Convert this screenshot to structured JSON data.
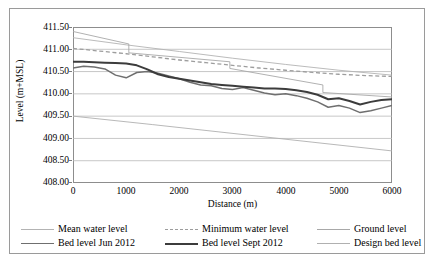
{
  "chart_data": {
    "type": "line",
    "title": "",
    "xlabel": "Distance (m)",
    "ylabel": "Level (m+MSL)",
    "xlim": [
      0,
      6000
    ],
    "ylim": [
      408.0,
      411.5
    ],
    "xticks": [
      "0",
      "1000",
      "2000",
      "3000",
      "4000",
      "5000",
      "6000"
    ],
    "yticks": [
      "411.50",
      "411.00",
      "410.50",
      "410.00",
      "409.50",
      "409.00",
      "408.50",
      "408.00"
    ],
    "grid": "horizontal",
    "legend_position": "bottom",
    "series": [
      {
        "name": "Mean water level",
        "style": "solid-thin-light",
        "color": "#b3b3b3",
        "x": [
          0,
          1000,
          2000,
          3000,
          4000,
          5000,
          6000
        ],
        "values": [
          411.26,
          411.1,
          410.95,
          410.8,
          410.66,
          410.53,
          410.42
        ]
      },
      {
        "name": "Minimum water level",
        "style": "dashed",
        "color": "#9d9d9d",
        "x": [
          0,
          500,
          1000,
          1500,
          2000,
          2500,
          3000,
          3500,
          4000,
          4500,
          5000,
          5500,
          6000
        ],
        "values": [
          411.02,
          410.96,
          410.9,
          410.83,
          410.76,
          410.7,
          410.64,
          410.58,
          410.53,
          410.48,
          410.44,
          410.41,
          410.39
        ]
      },
      {
        "name": "Ground level",
        "style": "solid-thin-stepped",
        "color": "#a8a8a8",
        "x": [
          0,
          1050,
          1050,
          2950,
          2950,
          4700,
          4700,
          6000
        ],
        "values": [
          411.4,
          411.12,
          410.92,
          410.72,
          410.57,
          410.2,
          410.03,
          409.93
        ]
      },
      {
        "name": "Bed level Jun 2012",
        "style": "solid-medium",
        "color": "#6f6f6f",
        "x": [
          0,
          200,
          400,
          600,
          800,
          1000,
          1200,
          1400,
          1600,
          1800,
          2000,
          2200,
          2400,
          2600,
          2800,
          3000,
          3200,
          3400,
          3600,
          3800,
          4000,
          4200,
          4400,
          4600,
          4800,
          5000,
          5200,
          5400,
          5600,
          5800,
          6000
        ],
        "values": [
          410.58,
          410.62,
          410.6,
          410.56,
          410.42,
          410.36,
          410.48,
          410.5,
          410.46,
          410.4,
          410.34,
          410.26,
          410.2,
          410.18,
          410.12,
          410.1,
          410.14,
          410.08,
          410.02,
          409.98,
          410.0,
          409.96,
          409.9,
          409.82,
          409.7,
          409.74,
          409.68,
          409.58,
          409.62,
          409.68,
          409.74
        ]
      },
      {
        "name": "Bed level Sept 2012",
        "style": "solid-thick-dark",
        "color": "#3c3c3c",
        "x": [
          0,
          200,
          400,
          600,
          800,
          1000,
          1200,
          1400,
          1600,
          1800,
          2000,
          2200,
          2400,
          2600,
          2800,
          3000,
          3200,
          3400,
          3600,
          3800,
          4000,
          4200,
          4400,
          4600,
          4800,
          5000,
          5200,
          5400,
          5600,
          5800,
          6000
        ],
        "values": [
          410.72,
          410.72,
          410.71,
          410.7,
          410.69,
          410.68,
          410.64,
          410.55,
          410.44,
          410.38,
          410.34,
          410.3,
          410.26,
          410.22,
          410.2,
          410.18,
          410.16,
          410.14,
          410.12,
          410.12,
          410.11,
          410.08,
          410.04,
          409.98,
          409.88,
          409.9,
          409.84,
          409.76,
          409.82,
          409.86,
          409.88
        ]
      },
      {
        "name": "Design bed level",
        "style": "solid-thin-light",
        "color": "#b0b0b0",
        "x": [
          0,
          1500,
          6000
        ],
        "values": [
          409.5,
          409.31,
          408.72
        ]
      }
    ]
  },
  "legend": {
    "rows": [
      [
        {
          "label": "Mean water level",
          "swatch": "sw-mean"
        },
        {
          "label": "Minimum water level",
          "swatch": "sw-min"
        },
        {
          "label": "Ground level",
          "swatch": "sw-ground"
        }
      ],
      [
        {
          "label": "Bed level Jun 2012",
          "swatch": "sw-jun"
        },
        {
          "label": "Bed level Sept 2012",
          "swatch": "sw-sept"
        },
        {
          "label": "Design bed level",
          "swatch": "sw-design"
        }
      ]
    ]
  }
}
